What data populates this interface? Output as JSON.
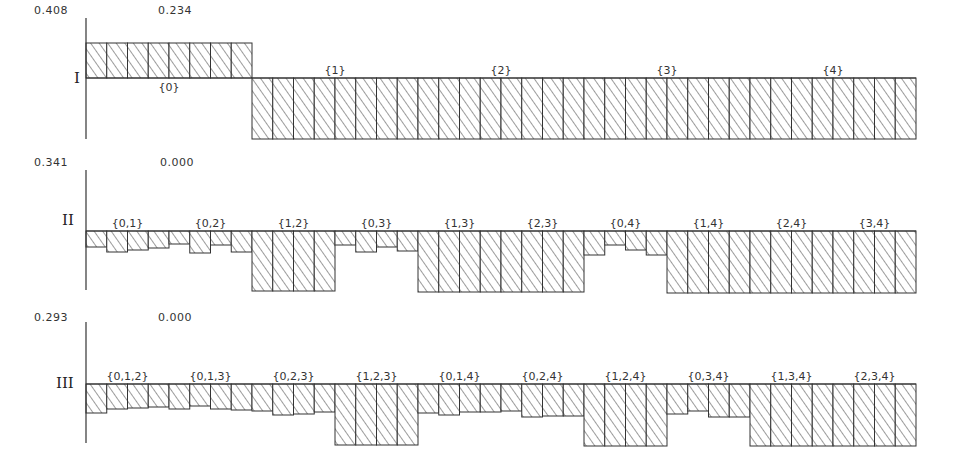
{
  "chart_data": [
    {
      "type": "bar",
      "panel": "I",
      "title": "I",
      "max_label": "0.408",
      "ref_label": "0.234",
      "column_count": 40,
      "group_labels": [
        {
          "label": "{0}",
          "col": 3.5,
          "position": "below"
        },
        {
          "label": "{1}",
          "col": 11.5,
          "position": "above"
        },
        {
          "label": "{2}",
          "col": 19.5,
          "position": "above"
        },
        {
          "label": "{3}",
          "col": 27.5,
          "position": "above"
        },
        {
          "label": "{4}",
          "col": 35.5,
          "position": "above"
        }
      ],
      "baseline_y": 78,
      "tops": [
        43,
        43,
        43,
        43,
        43,
        43,
        43,
        43,
        78,
        78,
        78,
        78,
        78,
        78,
        78,
        78,
        78,
        78,
        78,
        78,
        78,
        78,
        78,
        78,
        78,
        78,
        78,
        78,
        78,
        78,
        78,
        78,
        78,
        78,
        78,
        78,
        78,
        78,
        78,
        78
      ],
      "bottoms": [
        78,
        78,
        78,
        78,
        78,
        78,
        78,
        78,
        139,
        139,
        139,
        139,
        139,
        139,
        139,
        139,
        139,
        139,
        139,
        139,
        139,
        139,
        139,
        139,
        139,
        139,
        139,
        139,
        139,
        139,
        139,
        139,
        139,
        139,
        139,
        139,
        139,
        139,
        139,
        139
      ],
      "axis": {
        "top": 18,
        "bottom": 139
      }
    },
    {
      "type": "bar",
      "panel": "II",
      "title": "II",
      "max_label": "0.341",
      "ref_label": "0.000",
      "column_count": 40,
      "group_labels": [
        {
          "label": "{0,1}",
          "col": 1.5
        },
        {
          "label": "{0,2}",
          "col": 5.5
        },
        {
          "label": "{1,2}",
          "col": 9.5
        },
        {
          "label": "{0,3}",
          "col": 13.5
        },
        {
          "label": "{1,3}",
          "col": 17.5
        },
        {
          "label": "{2,3}",
          "col": 21.5
        },
        {
          "label": "{0,4}",
          "col": 25.5
        },
        {
          "label": "{1,4}",
          "col": 29.5
        },
        {
          "label": "{2,4}",
          "col": 33.5
        },
        {
          "label": "{3,4}",
          "col": 37.5
        }
      ],
      "baseline_y": 231,
      "bottoms": [
        247,
        252,
        250,
        248,
        244,
        253,
        245,
        252,
        291,
        291,
        291,
        291,
        245,
        252,
        247,
        251,
        292,
        292,
        292,
        292,
        292,
        292,
        292,
        292,
        255,
        245,
        250,
        255,
        293,
        293,
        293,
        293,
        293,
        293,
        293,
        293,
        293,
        293,
        293,
        293
      ],
      "axis": {
        "top": 170,
        "bottom": 290
      }
    },
    {
      "type": "bar",
      "panel": "III",
      "title": "III",
      "max_label": "0.293",
      "ref_label": "0.000",
      "column_count": 40,
      "group_labels": [
        {
          "label": "{0,1,2}",
          "col": 1.5
        },
        {
          "label": "{0,1,3}",
          "col": 5.5
        },
        {
          "label": "{0,2,3}",
          "col": 9.5
        },
        {
          "label": "{1,2,3}",
          "col": 13.5
        },
        {
          "label": "{0,1,4}",
          "col": 17.5
        },
        {
          "label": "{0,2,4}",
          "col": 21.5
        },
        {
          "label": "{1,2,4}",
          "col": 25.5
        },
        {
          "label": "{0,3,4}",
          "col": 29.5
        },
        {
          "label": "{1,3,4}",
          "col": 33.5
        },
        {
          "label": "{2,3,4}",
          "col": 37.5
        }
      ],
      "baseline_y": 384,
      "bottoms": [
        413,
        409,
        408,
        407,
        409,
        406,
        409,
        410,
        411,
        415,
        414,
        412,
        445,
        445,
        445,
        445,
        413,
        415,
        412,
        412,
        411,
        417,
        416,
        416,
        446,
        446,
        446,
        446,
        414,
        411,
        417,
        417,
        446,
        446,
        446,
        446,
        446,
        446,
        446,
        446
      ],
      "axis": {
        "top": 322,
        "bottom": 443
      }
    }
  ],
  "layout": {
    "x_start": 86,
    "x_end": 916
  }
}
